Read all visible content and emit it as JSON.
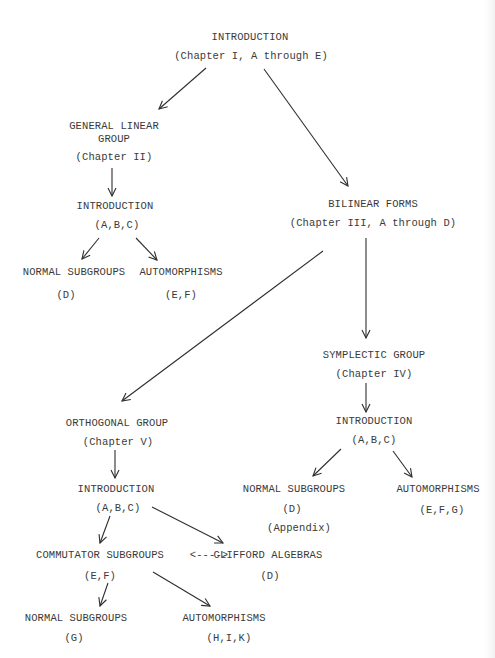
{
  "diagram": {
    "type": "dependency-chart",
    "nodes": {
      "intro_root": {
        "title": "INTRODUCTION",
        "sub": "(Chapter I, A through E)"
      },
      "gl_group": {
        "title1": "GENERAL LINEAR",
        "title2": "GROUP",
        "sub": "(Chapter II)"
      },
      "gl_intro": {
        "title": "INTRODUCTION",
        "sub": "(A,B,C)"
      },
      "gl_normal": {
        "title": "NORMAL SUBGROUPS",
        "sub": "(D)"
      },
      "gl_auto": {
        "title": "AUTOMORPHISMS",
        "sub": "(E,F)"
      },
      "bilinear": {
        "title": "BILINEAR FORMS",
        "sub": "(Chapter III, A through D)"
      },
      "symplectic": {
        "title": "SYMPLECTIC GROUP",
        "sub": "(Chapter IV)"
      },
      "sp_intro": {
        "title": "INTRODUCTION",
        "sub": "(A,B,C)"
      },
      "sp_normal": {
        "title": "NORMAL SUBGROUPS",
        "sub": "(D)",
        "sub2": "(Appendix)"
      },
      "sp_auto": {
        "title": "AUTOMORPHISMS",
        "sub": "(E,F,G)"
      },
      "orthogonal": {
        "title": "ORTHOGONAL GROUP",
        "sub": "(Chapter V)"
      },
      "o_intro": {
        "title": "INTRODUCTION",
        "sub": "(A,B,C)"
      },
      "o_commutator": {
        "title": "COMMUTATOR SUBGROUPS",
        "sub": "(E,F)"
      },
      "o_link": {
        "label": "<---->"
      },
      "o_clifford": {
        "title": "CLIFFORD ALGEBRAS",
        "sub": "(D)"
      },
      "o_normal": {
        "title": "NORMAL SUBGROUPS",
        "sub": "(G)"
      },
      "o_auto": {
        "title": "AUTOMORPHISMS",
        "sub": "(H,I,K)"
      }
    },
    "edges": [
      {
        "from": "INTRODUCTION (Chapter I)",
        "to": "GENERAL LINEAR GROUP (Chapter II)"
      },
      {
        "from": "INTRODUCTION (Chapter I)",
        "to": "BILINEAR FORMS (Chapter III)"
      },
      {
        "from": "GENERAL LINEAR GROUP",
        "to": "INTRODUCTION (A,B,C)"
      },
      {
        "from": "INTRODUCTION (A,B,C)",
        "to": "NORMAL SUBGROUPS (D)"
      },
      {
        "from": "INTRODUCTION (A,B,C)",
        "to": "AUTOMORPHISMS (E,F)"
      },
      {
        "from": "BILINEAR FORMS",
        "to": "ORTHOGONAL GROUP (Chapter V)"
      },
      {
        "from": "BILINEAR FORMS",
        "to": "SYMPLECTIC GROUP (Chapter IV)"
      },
      {
        "from": "SYMPLECTIC GROUP",
        "to": "INTRODUCTION (A,B,C)"
      },
      {
        "from": "INTRODUCTION (A,B,C)",
        "to": "NORMAL SUBGROUPS (D) (Appendix)"
      },
      {
        "from": "INTRODUCTION (A,B,C)",
        "to": "AUTOMORPHISMS (E,F,G)"
      },
      {
        "from": "ORTHOGONAL GROUP",
        "to": "INTRODUCTION (A,B,C)"
      },
      {
        "from": "INTRODUCTION (A,B,C)",
        "to": "COMMUTATOR SUBGROUPS (E,F)"
      },
      {
        "from": "INTRODUCTION (A,B,C)",
        "to": "CLIFFORD ALGEBRAS (D)"
      },
      {
        "from": "COMMUTATOR SUBGROUPS",
        "to": "CLIFFORD ALGEBRAS",
        "bidirectional": true
      },
      {
        "from": "COMMUTATOR SUBGROUPS (E,F)",
        "to": "NORMAL SUBGROUPS (G)"
      },
      {
        "from": "COMMUTATOR SUBGROUPS (E,F)",
        "to": "AUTOMORPHISMS (H,I,K)"
      }
    ]
  }
}
